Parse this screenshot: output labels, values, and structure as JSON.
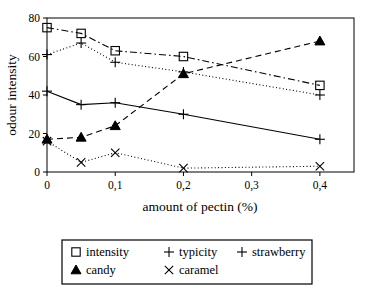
{
  "chart_data": {
    "type": "line",
    "title": "",
    "xlabel": "amount of pectin (%)",
    "ylabel": "odour intensity",
    "x": [
      0,
      0.05,
      0.1,
      0.2,
      0.4
    ],
    "xlim": [
      0,
      0.45
    ],
    "ylim": [
      0,
      80
    ],
    "xtick_values": [
      0,
      0.1,
      0.2,
      0.3,
      0.4
    ],
    "xtick_labels": [
      "0",
      "0,1",
      "0,2",
      "0,3",
      "0,4"
    ],
    "ytick_values": [
      0,
      20,
      40,
      60,
      80
    ],
    "ytick_labels": [
      "0",
      "20",
      "40",
      "60",
      "80"
    ],
    "grid": false,
    "legend_position": "below-outside",
    "series": [
      {
        "name": "intensity",
        "values": [
          75,
          72,
          63,
          60,
          45
        ],
        "marker": "open-square",
        "linestyle": "dash-dot",
        "color": "#000000"
      },
      {
        "name": "typicity",
        "values": [
          42,
          35,
          36,
          30,
          17
        ],
        "marker": "plus",
        "linestyle": "solid",
        "color": "#000000"
      },
      {
        "name": "strawberry",
        "values": [
          61,
          67,
          57,
          52,
          40
        ],
        "marker": "plus",
        "linestyle": "dotted",
        "color": "#000000"
      },
      {
        "name": "candy",
        "values": [
          17,
          18,
          24,
          51,
          68
        ],
        "marker": "filled-triangle",
        "linestyle": "dashed",
        "color": "#000000"
      },
      {
        "name": "caramel",
        "values": [
          16,
          5,
          10,
          2,
          3
        ],
        "marker": "cross",
        "linestyle": "dotted",
        "color": "#000000"
      }
    ]
  },
  "legend": {
    "row1": [
      "intensity",
      "typicity",
      "strawberry"
    ],
    "row2": [
      "candy",
      "caramel"
    ]
  },
  "axes": {
    "x_title": "amount of pectin (%)",
    "y_title": "odour intensity"
  }
}
